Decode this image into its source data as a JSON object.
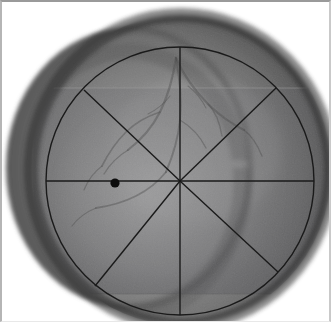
{
  "viewer": {
    "name": "fundus-image-viewer",
    "width": 331,
    "height": 322,
    "background_color": "#ffffff",
    "frame_color": "#9a9a9a",
    "modality": "grayscale retinal fundus photograph",
    "alt_text": "Grayscale retinal fundus photograph composed of two overlapping circular fundus views with a circular analysis grid and eight radial spokes overlaid"
  },
  "fundus": {
    "base_view": {
      "name": "primary-fundus-disc",
      "center_x": 181,
      "center_y": 170,
      "radius_x": 150,
      "radius_y": 155,
      "fill_light": "#8e8e8e",
      "fill_mid": "#6f6f6f",
      "fill_dark": "#3c3c3c"
    },
    "secondary_view": {
      "name": "secondary-fundus-disc",
      "center_x": 128,
      "center_y": 168,
      "radius_x": 122,
      "radius_y": 140,
      "fill_light": "#7b7b7b",
      "fill_mid": "#606060",
      "fill_dark": "#363636"
    },
    "overlay_rect": {
      "name": "registered-frame-patch",
      "x": 33,
      "y": 88,
      "width": 298,
      "height": 206,
      "tint": "#5f6065"
    },
    "optic_disc_glow": {
      "name": "optic-disc-highlight",
      "center_x": 150,
      "center_y": 196,
      "radius": 96,
      "color": "#b4b4b4"
    }
  },
  "vessels": {
    "name": "retinal-vessel-tree",
    "stroke": "#4f4f4f",
    "opacity": 0.45,
    "paths": [
      "M 176 58 C 173 78, 168 96, 160 112 C 152 128, 141 140, 128 150",
      "M 176 58 C 180 80, 182 100, 180 120 C 178 140, 172 158, 166 172",
      "M 176 58 C 184 76, 196 92, 208 104 C 220 116, 232 124, 244 130",
      "M 160 112 C 148 116, 136 122, 126 132 C 116 142, 108 154, 102 166",
      "M 180 120 C 190 126, 200 136, 206 148",
      "M 166 172 C 158 182, 148 190, 136 196 C 124 202, 110 206, 96 208",
      "M 208 104 C 216 112, 220 124, 222 136",
      "M 128 150 C 118 156, 110 164, 104 174",
      "M 244 130 C 252 136, 258 146, 262 156",
      "M 102 166 C 94 172, 88 180, 84 190",
      "M 96 208 C 86 212, 78 218, 72 226"
    ]
  },
  "grid": {
    "name": "radial-analysis-grid",
    "stroke_color": "#1a1a1a",
    "stroke_width": 1.4,
    "circle": {
      "name": "grid-boundary-circle",
      "center_x": 180,
      "center_y": 181,
      "radius": 134
    },
    "spokes": [
      {
        "name": "spoke-north",
        "angle_deg": 90,
        "end_x": 180,
        "end_y": 47
      },
      {
        "name": "spoke-northeast",
        "angle_deg": 44,
        "end_x": 276,
        "end_y": 88
      },
      {
        "name": "spoke-east",
        "angle_deg": 0,
        "end_x": 314,
        "end_y": 181
      },
      {
        "name": "spoke-southeast",
        "angle_deg": -43,
        "end_x": 278,
        "end_y": 272
      },
      {
        "name": "spoke-south",
        "angle_deg": -90,
        "end_x": 180,
        "end_y": 315
      },
      {
        "name": "spoke-southwest",
        "angle_deg": -129,
        "end_x": 95,
        "end_y": 286
      },
      {
        "name": "spoke-west",
        "angle_deg": 180,
        "end_x": 46,
        "end_y": 181
      },
      {
        "name": "spoke-northwest",
        "angle_deg": 135,
        "end_x": 84,
        "end_y": 90
      }
    ]
  },
  "marker": {
    "name": "fovea-marker",
    "label": "",
    "center_x": 115,
    "center_y": 183,
    "radius": 4.6,
    "color": "#0d0d0d"
  }
}
